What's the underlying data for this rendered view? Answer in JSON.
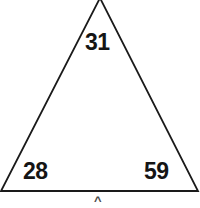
{
  "figure": {
    "name": "triangle-angle-diagram",
    "shape": "triangle",
    "background_color": "#ffffff",
    "stroke_color": "#1a1a1a",
    "stroke_width": 1.8,
    "fill": "none",
    "canvas": {
      "width": 200,
      "height": 208
    },
    "vertices": {
      "apex": {
        "x": 100,
        "y": 0,
        "clipped_at_top": true
      },
      "bottom_left": {
        "x": 1,
        "y": 191
      },
      "bottom_right": {
        "x": 198,
        "y": 191
      }
    }
  },
  "labels": {
    "apex": {
      "text": "31",
      "position": "interior-top"
    },
    "bottom_left": {
      "text": "28",
      "position": "interior-bottom-left"
    },
    "bottom_right": {
      "text": "59",
      "position": "interior-bottom-right"
    }
  },
  "marks": {
    "base_tick": {
      "glyph": "^",
      "position": "below-base-center",
      "clipped_at_bottom": true
    }
  }
}
